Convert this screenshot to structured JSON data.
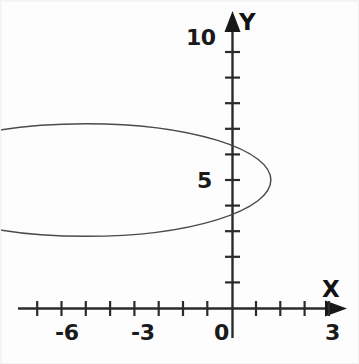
{
  "figure": {
    "background_color": "#fdfdfd",
    "ink_color": "#2b2b2b",
    "curve_color": "#4a4a4a"
  },
  "axes": {
    "x_axis_name": "X",
    "y_axis_name": "Y",
    "x_labels": [
      {
        "text": "-6",
        "value": -6
      },
      {
        "text": "-3",
        "value": -3
      },
      {
        "text": "0",
        "value": 0
      },
      {
        "text": "3",
        "value": 3
      }
    ],
    "y_labels": [
      {
        "text": "5",
        "value": 5
      },
      {
        "text": "10",
        "value": 10
      }
    ]
  },
  "chart_data": {
    "type": "line",
    "title": "",
    "xlabel": "X",
    "ylabel": "Y",
    "xlim": [
      -7.5,
      3.4
    ],
    "ylim": [
      -0.6,
      10.6
    ],
    "grid": false,
    "legend": false,
    "x_ticks": [
      -7,
      -6.5,
      -6,
      -5.5,
      -5,
      -4.5,
      -4,
      -3.5,
      -3,
      -2.5,
      -2,
      -1.5,
      -1,
      -0.5,
      0,
      0.5,
      1,
      1.5,
      2,
      2.5,
      3
    ],
    "x_tick_labels": [
      "",
      "",
      "-6",
      "",
      "",
      "",
      "",
      "",
      "-3",
      "",
      "",
      "",
      "",
      "",
      "0",
      "",
      "",
      "",
      "",
      "",
      "3"
    ],
    "y_ticks": [
      0,
      1,
      2,
      3,
      4,
      5,
      6,
      7,
      8,
      9,
      10
    ],
    "y_tick_labels": [
      "",
      "",
      "",
      "",
      "",
      "5",
      "",
      "",
      "",
      "",
      "10"
    ],
    "x_major_labeled": [
      -6,
      -3,
      0,
      3
    ],
    "y_major_labeled": [
      5,
      10
    ],
    "series": [
      {
        "name": "ellipse",
        "shape": "ellipse",
        "center": [
          -3.0,
          5.0
        ],
        "semi_axis_x": 3.8,
        "semi_axis_y": 2.2,
        "x_range": [
          -6.8,
          0.8
        ],
        "y_range": [
          2.8,
          7.2
        ],
        "equation": "(x + 3)^2 / 3.8^2 + (y - 5)^2 / 2.2^2 = 1",
        "y_axis_intercepts": [
          3.1,
          6.9
        ],
        "closed": true,
        "filled": false,
        "line_width": 1
      }
    ]
  }
}
